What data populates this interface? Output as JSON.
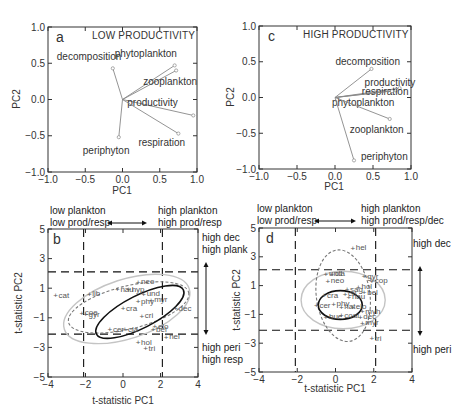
{
  "chart_data": [
    {
      "panel": "a",
      "type": "scatter",
      "subtype": "pca-loading-vectors",
      "title": "LOW PRODUCTIVITY",
      "xlabel": "PC1",
      "ylabel": "PC2",
      "xlim": [
        -1.0,
        1.0
      ],
      "ylim": [
        -1.0,
        1.0
      ],
      "xticks": [
        "−1.0",
        "−0.5",
        "0.0",
        "0.5",
        "1.0"
      ],
      "yticks": [
        "−1.0",
        "−0.5",
        "0.0",
        "0.5",
        "1.0"
      ],
      "vectors": [
        {
          "name": "decomposition",
          "x": -0.13,
          "y": 0.43
        },
        {
          "name": "phytoplankton",
          "x": 0.7,
          "y": 0.47
        },
        {
          "name": "zooplankton",
          "x": 0.72,
          "y": 0.4
        },
        {
          "name": "productivity",
          "x": 0.95,
          "y": -0.22
        },
        {
          "name": "respiration",
          "x": 0.75,
          "y": -0.47
        },
        {
          "name": "periphyton",
          "x": -0.05,
          "y": -0.52
        }
      ]
    },
    {
      "panel": "c",
      "type": "scatter",
      "subtype": "pca-loading-vectors",
      "title": "HIGH PRODUCTIVITY",
      "xlabel": "PC1",
      "ylabel": "PC2",
      "xlim": [
        -1.0,
        1.0
      ],
      "ylim": [
        -1.0,
        1.0
      ],
      "xticks": [
        "−1.0",
        "−0.5",
        "0.0",
        "0.5",
        "1.0"
      ],
      "yticks": [
        "−1.0",
        "−0.5",
        "0.0",
        "0.5",
        "1.0"
      ],
      "vectors": [
        {
          "name": "decomposition",
          "x": 0.48,
          "y": 0.4
        },
        {
          "name": "productivity",
          "x": 0.85,
          "y": 0.13
        },
        {
          "name": "respiration",
          "x": 0.8,
          "y": 0.1
        },
        {
          "name": "phytoplankton",
          "x": 0.75,
          "y": 0.09
        },
        {
          "name": "zooplankton",
          "x": 0.72,
          "y": -0.3
        },
        {
          "name": "periphyton",
          "x": 0.25,
          "y": -0.88
        }
      ]
    },
    {
      "panel": "b",
      "type": "scatter",
      "xlabel": "t-statistic PC1",
      "ylabel": "t-statistic PC2",
      "xlim": [
        -4,
        4
      ],
      "ylim": [
        -5,
        5
      ],
      "xticks": [
        "−4",
        "−2",
        "0",
        "2",
        "4"
      ],
      "yticks": [
        "−5",
        "−3",
        "−1",
        "1",
        "3",
        "5"
      ],
      "thresholds": {
        "x": [
          -2.1,
          2.1
        ],
        "y": [
          -2.1,
          2.1
        ]
      },
      "top_left_annotation": [
        "low plankton",
        "low prod/resp"
      ],
      "top_right_annotation": [
        "high plankton",
        "high prod/resp"
      ],
      "right_top_annotation": [
        "high dec",
        "high plank"
      ],
      "right_bottom_annotation": [
        "high peri",
        "high resp"
      ],
      "points": [
        {
          "label": "cat",
          "x": -3.6,
          "y": 0.5
        },
        {
          "label": "coe",
          "x": -2.2,
          "y": -0.7
        },
        {
          "label": "gyr",
          "x": -2.0,
          "y": -0.8
        },
        {
          "label": "lib",
          "x": -1.8,
          "y": 0.6
        },
        {
          "label": "nau",
          "x": -0.3,
          "y": 0.9
        },
        {
          "label": "neo",
          "x": 0.8,
          "y": 1.4
        },
        {
          "label": "hyp",
          "x": 0.3,
          "y": 0.9
        },
        {
          "label": "und",
          "x": 1.1,
          "y": 0.6
        },
        {
          "label": "phy",
          "x": 0.8,
          "y": 0.1
        },
        {
          "label": "myr",
          "x": 1.5,
          "y": 0.2
        },
        {
          "label": "cra",
          "x": 0.0,
          "y": -0.4
        },
        {
          "label": "cri",
          "x": 1.0,
          "y": -0.9
        },
        {
          "label": "dec",
          "x": 2.8,
          "y": -0.4
        },
        {
          "label": "elo",
          "x": 1.7,
          "y": -1.6
        },
        {
          "label": "cer",
          "x": -0.7,
          "y": -1.8
        },
        {
          "label": "cla",
          "x": 0.1,
          "y": -1.8
        },
        {
          "label": "bel",
          "x": 1.6,
          "y": -1.8
        },
        {
          "label": "hel",
          "x": 2.3,
          "y": -2.3
        },
        {
          "label": "hol",
          "x": 0.8,
          "y": -2.7
        },
        {
          "label": "tri",
          "x": 1.2,
          "y": -3.1
        }
      ],
      "ellipses": [
        {
          "style": "solid-black",
          "cx": 0.9,
          "cy": -0.6,
          "rx": 2.6,
          "ry": 1.1,
          "angle_deg": -27
        },
        {
          "style": "dashed-gray",
          "cx": 0.3,
          "cy": -0.3,
          "rx": 3.3,
          "ry": 1.45,
          "angle_deg": -14
        },
        {
          "style": "solid-lightgray",
          "cx": 0.2,
          "cy": -0.4,
          "rx": 3.5,
          "ry": 2.0,
          "angle_deg": -18
        }
      ]
    },
    {
      "panel": "d",
      "type": "scatter",
      "xlabel": "t-statistic PC1",
      "ylabel": "t-statistic PC2",
      "xlim": [
        -4,
        4
      ],
      "ylim": [
        -5,
        5
      ],
      "xticks": [
        "−4",
        "−2",
        "0",
        "2",
        "4"
      ],
      "yticks": [
        "−5",
        "−3",
        "−1",
        "1",
        "3",
        "5"
      ],
      "thresholds": {
        "x": [
          -2.1,
          2.1
        ],
        "y": [
          -2.1,
          2.1
        ]
      },
      "top_left_annotation": [
        "low plankton",
        "low prod/resp"
      ],
      "top_right_annotation": [
        "high plankton",
        "high prod/resp/dec"
      ],
      "right_top_annotation": [
        "high dec"
      ],
      "right_bottom_annotation": [
        "high peri"
      ],
      "points": [
        {
          "label": "hel",
          "x": 0.9,
          "y": 3.6
        },
        {
          "label": "und",
          "x": -0.5,
          "y": 1.8
        },
        {
          "label": "cla",
          "x": -0.2,
          "y": 1.8
        },
        {
          "label": "neo",
          "x": -0.4,
          "y": 1.3
        },
        {
          "label": "gyr",
          "x": 1.5,
          "y": 1.6
        },
        {
          "label": "cop",
          "x": 1.9,
          "y": 1.3
        },
        {
          "label": "sag",
          "x": 0.6,
          "y": 0.7
        },
        {
          "label": "hol",
          "x": 1.2,
          "y": 0.9
        },
        {
          "label": "bel",
          "x": 1.5,
          "y": 0.5
        },
        {
          "label": "cri",
          "x": 0.5,
          "y": 0.4
        },
        {
          "label": "nau",
          "x": 0.7,
          "y": 0.2
        },
        {
          "label": "cra",
          "x": -0.6,
          "y": 0.3
        },
        {
          "label": "cer",
          "x": -1.0,
          "y": -0.4
        },
        {
          "label": "phy",
          "x": -0.1,
          "y": -0.3
        },
        {
          "label": "hat",
          "x": 0.3,
          "y": -0.5
        },
        {
          "label": "elo",
          "x": 0.9,
          "y": -0.5
        },
        {
          "label": "myh",
          "x": 1.4,
          "y": -0.8
        },
        {
          "label": "bue",
          "x": -0.5,
          "y": -1.2
        },
        {
          "label": "coal",
          "x": 0.3,
          "y": -1.1
        },
        {
          "label": "dec",
          "x": 1.3,
          "y": -1.2
        },
        {
          "label": "myr",
          "x": 1.4,
          "y": -1.6
        },
        {
          "label": "tri",
          "x": 1.9,
          "y": -2.7
        }
      ],
      "ellipses": [
        {
          "style": "solid-black",
          "cx": 0.25,
          "cy": -0.35,
          "rx": 1.15,
          "ry": 1.0,
          "angle_deg": 0
        },
        {
          "style": "dashed-gray",
          "cx": 0.4,
          "cy": 0.3,
          "rx": 1.4,
          "ry": 3.2,
          "angle_deg": -8
        },
        {
          "style": "solid-lightgray",
          "cx": 0.4,
          "cy": 0.0,
          "rx": 2.2,
          "ry": 2.0,
          "angle_deg": 0
        }
      ]
    }
  ],
  "labels": {
    "a": {
      "panel_letter": "a",
      "title": "LOW PRODUCTIVITY",
      "xlabel": "PC1",
      "ylabel": "PC2"
    },
    "c": {
      "panel_letter": "c",
      "title": "HIGH PRODUCTIVITY",
      "xlabel": "PC1",
      "ylabel": "PC2"
    },
    "b": {
      "panel_letter": "b",
      "xlabel": "t-statistic PC1",
      "ylabel": "t-statistic PC2",
      "tl1": "low plankton",
      "tl2": "low prod/resp",
      "tr1": "high plankton",
      "tr2": "high prod/resp",
      "rt1": "high dec",
      "rt2": "high plank",
      "rb1": "high peri",
      "rb2": "high resp"
    },
    "d": {
      "panel_letter": "d",
      "xlabel": "t-statistic PC1",
      "ylabel": "t-statistic PC2",
      "tl1": "low plankton",
      "tl2": "low prod/resp",
      "tr1": "high plankton",
      "tr2": "high prod/resp/dec",
      "rt1": "high dec",
      "rb1": "high peri"
    }
  },
  "colors": {
    "axis": "#333333",
    "vector": "#888888",
    "solid": "#111111",
    "dashed": "#777777",
    "light": "#c4c4c4",
    "point": "#777777"
  }
}
